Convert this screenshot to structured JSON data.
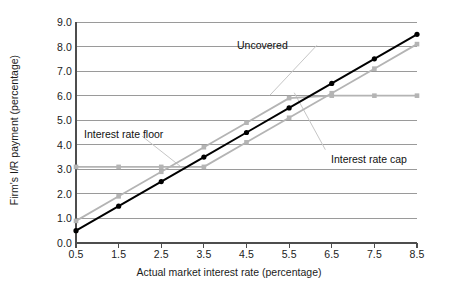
{
  "chart_data": {
    "type": "line",
    "title": "",
    "xlabel": "Actual market interest rate (percentage)",
    "ylabel": "Firm's I/R payment (percentage)",
    "xlim": [
      0.5,
      8.5
    ],
    "ylim": [
      0.0,
      9.0
    ],
    "grid": "horizontal",
    "legend_position": "inline-annotations",
    "x": [
      0.5,
      1.5,
      2.5,
      3.5,
      4.5,
      5.5,
      6.5,
      7.5,
      8.5
    ],
    "xticks": [
      "0.5",
      "1.5",
      "2.5",
      "3.5",
      "4.5",
      "5.5",
      "6.5",
      "7.5",
      "8.5"
    ],
    "yticks": [
      "0.0",
      "1.0",
      "2.0",
      "3.0",
      "4.0",
      "5.0",
      "6.0",
      "7.0",
      "8.0",
      "9.0"
    ],
    "series": [
      {
        "name": "Uncovered",
        "color": "#000000",
        "values": [
          0.5,
          1.5,
          2.5,
          3.5,
          4.5,
          5.5,
          6.5,
          7.5,
          8.5
        ]
      },
      {
        "name": "Interest rate cap",
        "color": "#b4b4b4",
        "values": [
          0.9,
          1.9,
          2.9,
          3.9,
          4.9,
          5.9,
          6.0,
          6.0,
          6.0
        ]
      },
      {
        "name": "Interest rate floor",
        "color": "#b4b4b4",
        "values": [
          3.1,
          3.1,
          3.1,
          3.1,
          4.1,
          5.1,
          6.1,
          7.1,
          8.1
        ]
      }
    ],
    "annotations": [
      {
        "text": "Uncovered",
        "x": 5.3,
        "y": 8.2
      },
      {
        "text": "Interest rate floor",
        "x": 1.0,
        "y": 4.55
      },
      {
        "text": "Interest rate cap",
        "x": 6.6,
        "y": 3.55
      }
    ]
  },
  "axes": {
    "x_title": "Actual market interest rate (percentage)",
    "y_title": "Firm's I/R payment (percentage)"
  },
  "labels": {
    "uncovered": "Uncovered",
    "floor": "Interest rate floor",
    "cap": "Interest rate cap"
  },
  "colors": {
    "uncovered_line": "#000000",
    "covered_line": "#b4b4b4",
    "gridline": "#9a9a9a",
    "axis": "#4d4d4d",
    "text": "#1b1b1b",
    "background": "#ffffff"
  }
}
